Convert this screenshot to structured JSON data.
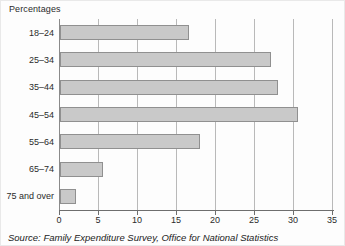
{
  "chart_data": {
    "type": "bar",
    "orientation": "horizontal",
    "title": "Percentages",
    "categories": [
      "18–24",
      "25–34",
      "35–44",
      "45–54",
      "55–64",
      "65–74",
      "75 and over"
    ],
    "values": [
      16.5,
      27,
      28,
      30.5,
      18,
      5.5,
      2
    ],
    "xlabel": "",
    "ylabel": "Percentages",
    "xlim": [
      0,
      35
    ],
    "xticks": [
      0,
      5,
      10,
      15,
      20,
      25,
      30,
      35
    ],
    "grid": "vertical",
    "legend": "none",
    "source": "Source: Family Expenditure Survey, Office for National Statistics",
    "colors": {
      "bar_fill": "#c9c9c9",
      "bar_border": "#909090",
      "gridline": "#b9b9b9",
      "axis": "#6e6e6e",
      "text": "#2b2b2b"
    }
  }
}
